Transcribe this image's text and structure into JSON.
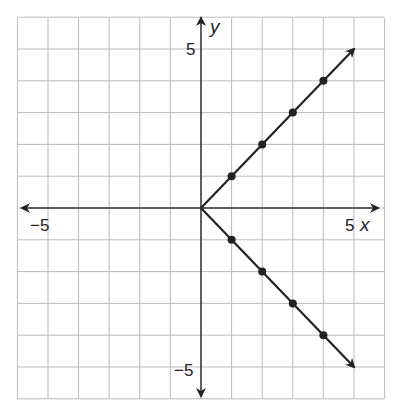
{
  "chart_data": {
    "type": "line",
    "title": "",
    "xlabel": "x",
    "ylabel": "y",
    "xlim": [
      -6,
      6
    ],
    "ylim": [
      -6,
      6
    ],
    "grid": true,
    "tick_labels": {
      "x": [
        "−5",
        "5"
      ],
      "y": [
        "5",
        "−5"
      ]
    },
    "series": [
      {
        "name": "upper ray",
        "x": [
          0,
          1,
          2,
          3,
          4
        ],
        "y": [
          0,
          1,
          2,
          3,
          4
        ],
        "points_marked": [
          [
            1,
            1
          ],
          [
            2,
            2
          ],
          [
            3,
            3
          ],
          [
            4,
            4
          ]
        ],
        "arrow_end": [
          5,
          5
        ]
      },
      {
        "name": "lower ray",
        "x": [
          0,
          1,
          2,
          3,
          4
        ],
        "y": [
          0,
          -1,
          -2,
          -3,
          -4
        ],
        "points_marked": [
          [
            1,
            -1
          ],
          [
            2,
            -2
          ],
          [
            3,
            -3
          ],
          [
            4,
            -4
          ]
        ],
        "arrow_end": [
          5,
          -5
        ]
      }
    ]
  },
  "labels": {
    "x_axis": "x",
    "y_axis": "y",
    "x_neg5": "−5",
    "x_pos5": "5",
    "y_pos5": "5",
    "y_neg5": "−5"
  }
}
